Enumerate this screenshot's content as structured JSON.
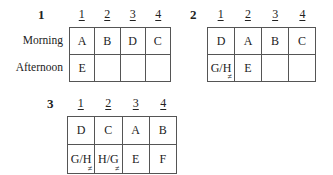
{
  "row_labels": [
    "Morning",
    "Afternoon"
  ],
  "column_headers": [
    "1",
    "2",
    "3",
    "4"
  ],
  "blocks": [
    {
      "number": "1",
      "rows": [
        [
          {
            "text": "A"
          },
          {
            "text": "B"
          },
          {
            "text": "D"
          },
          {
            "text": "C"
          }
        ],
        [
          {
            "text": "E"
          },
          {
            "text": ""
          },
          {
            "text": ""
          },
          {
            "text": ""
          }
        ]
      ]
    },
    {
      "number": "2",
      "rows": [
        [
          {
            "text": "D"
          },
          {
            "text": "A"
          },
          {
            "text": "B"
          },
          {
            "text": "C"
          }
        ],
        [
          {
            "text": "G/H",
            "mark": "≠"
          },
          {
            "text": "E"
          },
          {
            "text": ""
          },
          {
            "text": ""
          }
        ]
      ]
    },
    {
      "number": "3",
      "rows": [
        [
          {
            "text": "D"
          },
          {
            "text": "C"
          },
          {
            "text": "A"
          },
          {
            "text": "B"
          }
        ],
        [
          {
            "text": "G/H",
            "mark": "≠"
          },
          {
            "text": "H/G",
            "mark": "≠"
          },
          {
            "text": "E"
          },
          {
            "text": "F"
          }
        ]
      ]
    }
  ]
}
